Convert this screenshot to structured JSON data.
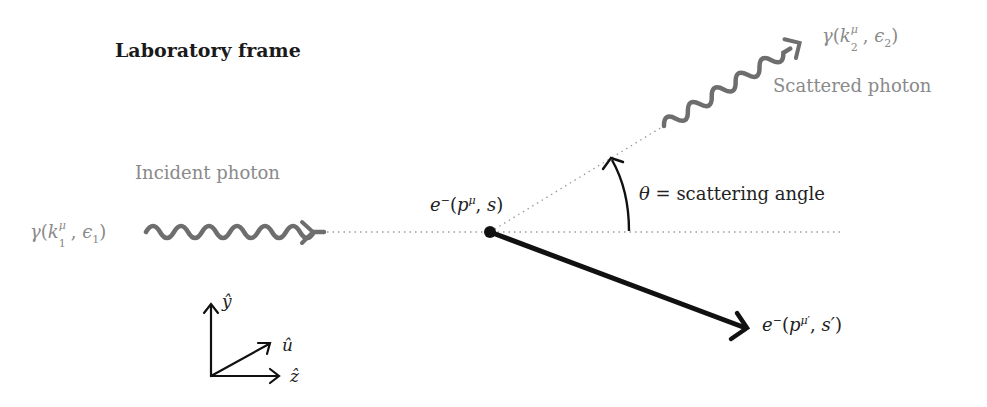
{
  "title": "Laboratory frame",
  "incident": {
    "caption": "Incident photon",
    "symbol": "γ",
    "momentum": "k",
    "index": "1",
    "mu": "μ",
    "polarization": "ϵ",
    "pol_index": "1"
  },
  "scattered": {
    "caption": "Scattered photon",
    "symbol": "γ",
    "momentum": "k",
    "index": "2",
    "mu": "μ",
    "polarization": "ϵ",
    "pol_index": "2"
  },
  "electron_initial": {
    "symbol": "e",
    "charge": "−",
    "momentum": "p",
    "mu": "μ",
    "spin": "s"
  },
  "electron_final": {
    "symbol": "e",
    "charge": "−",
    "momentum": "p",
    "mu": "μ",
    "prime": "′",
    "spin": "s′"
  },
  "angle": {
    "symbol": "θ",
    "label": "= scattering angle"
  },
  "axes": {
    "y": "ŷ",
    "u": "û",
    "z": "ẑ"
  },
  "colors": {
    "photon": "#6e6e6e",
    "electron": "#111111",
    "text_gray": "#8a8a8a",
    "dotted": "#9a9a9a"
  }
}
